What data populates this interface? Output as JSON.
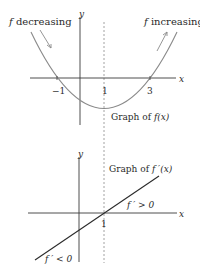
{
  "top_graph": {
    "left_label_f": "f",
    "left_label_text": " decreasing",
    "right_label_f": "f",
    "right_label_text": " increasing",
    "y_axis_label": "y",
    "x_axis_label": "x",
    "ticks": [
      "−1",
      "1",
      "3"
    ],
    "caption_prefix": "Graph of ",
    "caption_func": "f(x)"
  },
  "bottom_graph": {
    "y_axis_label": "y",
    "x_axis_label": "x",
    "tick": "1",
    "caption_prefix": "Graph of ",
    "caption_func": "f ′(x)",
    "positive_label": "f ′ > 0",
    "negative_label": "f ′ < 0"
  },
  "colors": {
    "curve": "#8a8a8a",
    "line": "#2a2a2a",
    "axis": "#3a3a3a",
    "dashed": "#8a8a8a"
  }
}
